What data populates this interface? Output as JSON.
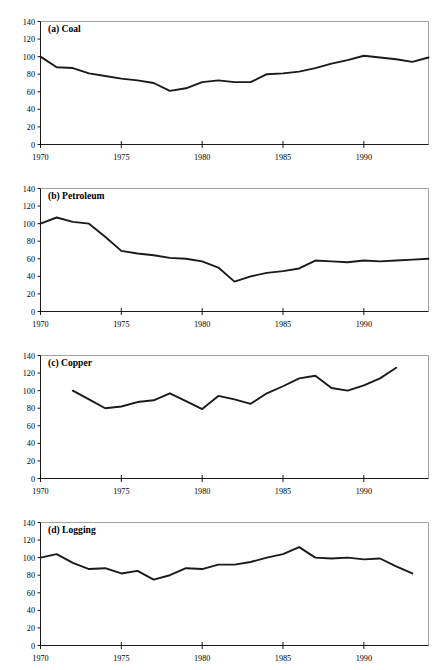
{
  "figure": {
    "background_color": "#ffffff",
    "line_color": "#1a1a1a",
    "axis_color": "#000000",
    "frame_color": "#8a8a8a"
  },
  "chart_data": [
    {
      "type": "line",
      "title": "(a) Coal",
      "panel_id": "a",
      "xlabel": "",
      "ylabel": "",
      "xlim": [
        1970,
        1994
      ],
      "ylim": [
        0,
        140
      ],
      "yticks": [
        0,
        20,
        40,
        60,
        80,
        100,
        120,
        140
      ],
      "ytick_labels": [
        "0",
        "20",
        "40",
        "60",
        "80",
        "100",
        "120",
        "140"
      ],
      "xticks": [
        1970,
        1975,
        1980,
        1985,
        1990
      ],
      "xtick_labels": [
        "1970",
        "1975",
        "1980",
        "1985",
        "1990"
      ],
      "grid": false,
      "legend": false,
      "x": [
        1970,
        1971,
        1972,
        1973,
        1974,
        1975,
        1976,
        1977,
        1978,
        1979,
        1980,
        1981,
        1982,
        1983,
        1984,
        1985,
        1986,
        1987,
        1988,
        1989,
        1990,
        1991,
        1992,
        1993,
        1994
      ],
      "values": [
        100,
        88,
        87,
        81,
        78,
        75,
        73,
        70,
        61,
        64,
        71,
        73,
        71,
        71,
        80,
        81,
        83,
        87,
        92,
        96,
        101,
        99,
        97,
        94,
        99
      ]
    },
    {
      "type": "line",
      "title": "(b) Petroleum",
      "panel_id": "b",
      "xlabel": "",
      "ylabel": "",
      "xlim": [
        1970,
        1994
      ],
      "ylim": [
        0,
        140
      ],
      "yticks": [
        0,
        20,
        40,
        60,
        80,
        100,
        120,
        140
      ],
      "ytick_labels": [
        "0",
        "20",
        "40",
        "60",
        "80",
        "100",
        "120",
        "140"
      ],
      "xticks": [
        1970,
        1975,
        1980,
        1985,
        1990
      ],
      "xtick_labels": [
        "1970",
        "1975",
        "1980",
        "1985",
        "1990"
      ],
      "grid": false,
      "legend": false,
      "x": [
        1970,
        1971,
        1972,
        1973,
        1974,
        1975,
        1976,
        1977,
        1978,
        1979,
        1980,
        1981,
        1982,
        1983,
        1984,
        1985,
        1986,
        1987,
        1988,
        1989,
        1990,
        1991,
        1992,
        1993,
        1994
      ],
      "values": [
        100,
        107,
        102,
        100,
        85,
        69,
        66,
        64,
        61,
        60,
        57,
        50,
        34,
        40,
        44,
        46,
        49,
        58,
        57,
        56,
        58,
        57,
        58,
        59,
        60
      ]
    },
    {
      "type": "line",
      "title": "(c) Copper",
      "panel_id": "c",
      "xlabel": "",
      "ylabel": "",
      "xlim": [
        1970,
        1994
      ],
      "ylim": [
        0,
        140
      ],
      "yticks": [
        0,
        20,
        40,
        60,
        80,
        100,
        120,
        140
      ],
      "ytick_labels": [
        "0",
        "20",
        "40",
        "60",
        "80",
        "100",
        "120",
        "140"
      ],
      "xticks": [
        1970,
        1975,
        1980,
        1985,
        1990
      ],
      "xtick_labels": [
        "1970",
        "1975",
        "1980",
        "1985",
        "1990"
      ],
      "grid": false,
      "legend": false,
      "x": [
        1972,
        1973,
        1974,
        1975,
        1976,
        1977,
        1978,
        1979,
        1980,
        1981,
        1982,
        1983,
        1984,
        1985,
        1986,
        1987,
        1988,
        1989,
        1990,
        1991,
        1992
      ],
      "values": [
        100,
        90,
        80,
        82,
        87,
        89,
        97,
        88,
        79,
        94,
        90,
        85,
        97,
        105,
        114,
        117,
        103,
        100,
        106,
        114,
        126
      ]
    },
    {
      "type": "line",
      "title": "(d) Logging",
      "panel_id": "d",
      "xlabel": "",
      "ylabel": "",
      "xlim": [
        1970,
        1994
      ],
      "ylim": [
        0,
        140
      ],
      "yticks": [
        0,
        20,
        40,
        60,
        80,
        100,
        120,
        140
      ],
      "ytick_labels": [
        "0",
        "20",
        "40",
        "60",
        "80",
        "100",
        "120",
        "140"
      ],
      "xticks": [
        1970,
        1975,
        1980,
        1985,
        1990
      ],
      "xtick_labels": [
        "1970",
        "1975",
        "1980",
        "1985",
        "1990"
      ],
      "grid": false,
      "legend": false,
      "x": [
        1970,
        1971,
        1972,
        1973,
        1974,
        1975,
        1976,
        1977,
        1978,
        1979,
        1980,
        1981,
        1982,
        1983,
        1984,
        1985,
        1986,
        1987,
        1988,
        1989,
        1990,
        1991,
        1992,
        1993
      ],
      "values": [
        100,
        104,
        94,
        87,
        88,
        82,
        85,
        75,
        80,
        88,
        87,
        92,
        92,
        95,
        100,
        104,
        112,
        100,
        99,
        100,
        98,
        99,
        90,
        82
      ]
    }
  ]
}
